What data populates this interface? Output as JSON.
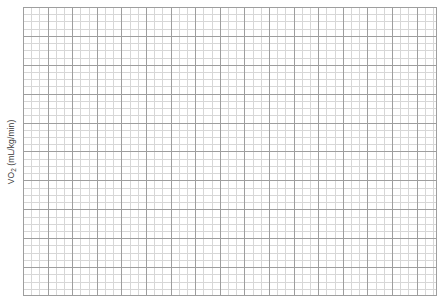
{
  "chart_data": {
    "type": "line",
    "title": "",
    "subtitle": "",
    "xlabel": "",
    "ylabel": "VO2 (mL/kg/min)",
    "ylabel_prefix": "VO",
    "ylabel_subscript": "2",
    "ylabel_suffix": " (mL/kg/min)",
    "series": [],
    "categories": [],
    "x": [],
    "values": [],
    "annotations": [],
    "legend": {
      "entries": [],
      "position": "none"
    },
    "axes": {
      "x_tick_labels": [],
      "y_tick_labels": [],
      "xlim": [],
      "ylim": []
    },
    "grid": {
      "visible": true,
      "style": "graph-paper",
      "minor_columns": 50,
      "minor_rows": 40,
      "major_every_columns": 3,
      "major_every_rows": 4,
      "minor_color": "#d7d7d7",
      "major_color": "#9e9e9e",
      "background_color": "#ffffff"
    }
  },
  "colors": {
    "page_background": "#ffffff",
    "grid_minor": "#d7d7d7",
    "grid_major": "#9e9e9e",
    "axis_label_text": "#3a3a3a"
  }
}
